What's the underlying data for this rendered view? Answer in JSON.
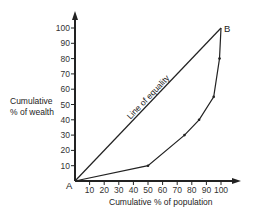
{
  "chart_data": {
    "type": "line",
    "title": "",
    "xlabel": "Cumulative % of population",
    "ylabel_lines": [
      "Cumulative",
      "% of wealth"
    ],
    "xlim": [
      0,
      100
    ],
    "ylim": [
      0,
      100
    ],
    "grid": false,
    "x_ticks": [
      10,
      20,
      30,
      40,
      50,
      60,
      70,
      80,
      90,
      100
    ],
    "y_ticks": [
      10,
      20,
      30,
      40,
      50,
      60,
      70,
      80,
      90,
      100
    ],
    "series": [
      {
        "name": "Line of equality",
        "points": [
          [
            0,
            0
          ],
          [
            100,
            100
          ]
        ]
      },
      {
        "name": "Lorenz curve",
        "points": [
          [
            0,
            0
          ],
          [
            50,
            10
          ],
          [
            75,
            30
          ],
          [
            85,
            40
          ],
          [
            95,
            55
          ],
          [
            99,
            80
          ],
          [
            100,
            100
          ]
        ]
      }
    ],
    "annotations": [
      {
        "text": "Line of equality",
        "along_series": "Line of equality"
      },
      {
        "text": "A",
        "at": [
          0,
          0
        ],
        "position": "bottom-left"
      },
      {
        "text": "B",
        "at": [
          100,
          100
        ],
        "position": "right"
      }
    ],
    "colors": {
      "ink": "#222222",
      "background": "#ffffff"
    }
  }
}
